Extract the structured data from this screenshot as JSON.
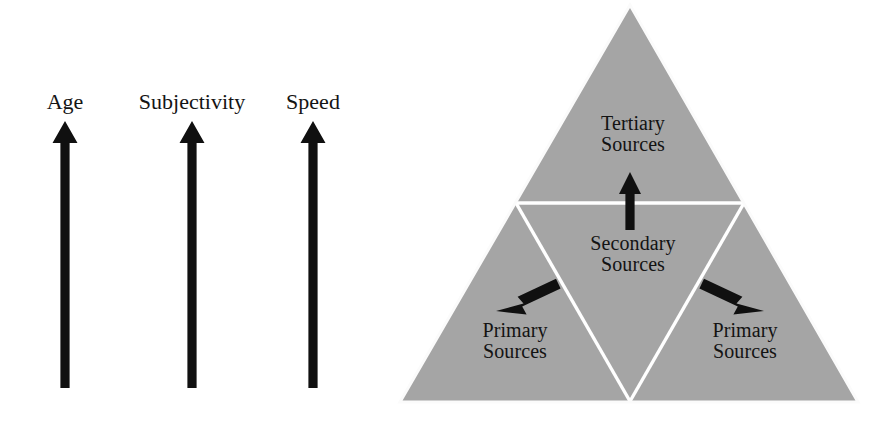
{
  "figure": {
    "title": "",
    "background_color": "#ffffff",
    "ink_color": "#131313",
    "triangle_fill": "#a5a5a5",
    "triangle_divider_color": "#ffffff"
  },
  "axes": {
    "items": [
      {
        "label": "Age",
        "icon": "up-arrow-icon",
        "center_x": 65
      },
      {
        "label": "Subjectivity",
        "icon": "up-arrow-icon",
        "center_x": 192
      },
      {
        "label": "Speed",
        "icon": "up-arrow-icon",
        "center_x": 313
      }
    ]
  },
  "pyramid": {
    "labels": {
      "tertiary": {
        "line1": "Tertiary",
        "line2": "Sources"
      },
      "secondary": {
        "line1": "Secondary",
        "line2": "Sources"
      },
      "primary_left": {
        "line1": "Primary",
        "line2": "Sources"
      },
      "primary_right": {
        "line1": "Primary",
        "line2": "Sources"
      }
    },
    "arrows": [
      {
        "name": "arrow-secondary-to-tertiary",
        "direction": "up"
      },
      {
        "name": "arrow-secondary-to-primary-left",
        "direction": "down-left"
      },
      {
        "name": "arrow-secondary-to-primary-right",
        "direction": "down-right"
      }
    ]
  }
}
